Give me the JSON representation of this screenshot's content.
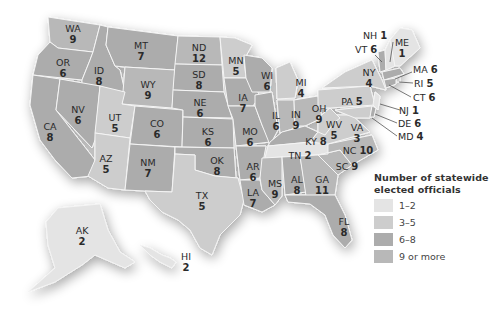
{
  "legend": {
    "title_line1": "Number of statewide",
    "title_line2": "elected officials",
    "items": [
      {
        "label": "1–2",
        "color": "#e4e4e4"
      },
      {
        "label": "3–5",
        "color": "#cdcdcd"
      },
      {
        "label": "6–8",
        "color": "#acacac"
      },
      {
        "label": "9 or more",
        "color": "#b8b8b8"
      }
    ]
  },
  "states": [
    {
      "abbr": "WA",
      "value": "9"
    },
    {
      "abbr": "OR",
      "value": "6"
    },
    {
      "abbr": "CA",
      "value": "8"
    },
    {
      "abbr": "ID",
      "value": "8"
    },
    {
      "abbr": "NV",
      "value": "6"
    },
    {
      "abbr": "MT",
      "value": "7"
    },
    {
      "abbr": "WY",
      "value": "9"
    },
    {
      "abbr": "UT",
      "value": "5"
    },
    {
      "abbr": "AZ",
      "value": "5"
    },
    {
      "abbr": "CO",
      "value": "6"
    },
    {
      "abbr": "NM",
      "value": "7"
    },
    {
      "abbr": "ND",
      "value": "12"
    },
    {
      "abbr": "SD",
      "value": "8"
    },
    {
      "abbr": "NE",
      "value": "6"
    },
    {
      "abbr": "KS",
      "value": "6"
    },
    {
      "abbr": "OK",
      "value": "8"
    },
    {
      "abbr": "TX",
      "value": "5"
    },
    {
      "abbr": "MN",
      "value": "5"
    },
    {
      "abbr": "IA",
      "value": "7"
    },
    {
      "abbr": "MO",
      "value": "6"
    },
    {
      "abbr": "AR",
      "value": "6"
    },
    {
      "abbr": "LA",
      "value": "7"
    },
    {
      "abbr": "WI",
      "value": "6"
    },
    {
      "abbr": "IL",
      "value": "6"
    },
    {
      "abbr": "MI",
      "value": "4"
    },
    {
      "abbr": "IN",
      "value": "9"
    },
    {
      "abbr": "OH",
      "value": "9"
    },
    {
      "abbr": "KY",
      "value": "8"
    },
    {
      "abbr": "TN",
      "value": "2"
    },
    {
      "abbr": "MS",
      "value": "9"
    },
    {
      "abbr": "AL",
      "value": "8"
    },
    {
      "abbr": "GA",
      "value": "11"
    },
    {
      "abbr": "FL",
      "value": "8"
    },
    {
      "abbr": "SC",
      "value": "9"
    },
    {
      "abbr": "NC",
      "value": "10"
    },
    {
      "abbr": "VA",
      "value": "3"
    },
    {
      "abbr": "WV",
      "value": "5"
    },
    {
      "abbr": "PA",
      "value": "5"
    },
    {
      "abbr": "NY",
      "value": "4"
    },
    {
      "abbr": "VT",
      "value": "6"
    },
    {
      "abbr": "NH",
      "value": "1"
    },
    {
      "abbr": "ME",
      "value": "1"
    },
    {
      "abbr": "MA",
      "value": "6"
    },
    {
      "abbr": "RI",
      "value": "5"
    },
    {
      "abbr": "CT",
      "value": "6"
    },
    {
      "abbr": "NJ",
      "value": "1"
    },
    {
      "abbr": "DE",
      "value": "6"
    },
    {
      "abbr": "MD",
      "value": "4"
    },
    {
      "abbr": "AK",
      "value": "2"
    },
    {
      "abbr": "HI",
      "value": "2"
    }
  ],
  "colors": {
    "c12": "#e4e4e4",
    "c35": "#cdcdcd",
    "c68": "#acacac",
    "c9": "#b8b8b8"
  }
}
